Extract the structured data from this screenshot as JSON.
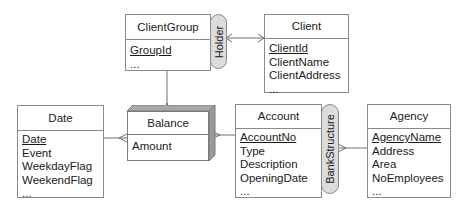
{
  "diagram": {
    "type": "entity-relationship",
    "entities": [
      {
        "id": "clientgroup",
        "name": "ClientGroup",
        "key": "GroupId",
        "attributes": [
          "..."
        ]
      },
      {
        "id": "client",
        "name": "Client",
        "key": "ClientId",
        "attributes": [
          "ClientName",
          "ClientAddress",
          "..."
        ]
      },
      {
        "id": "date",
        "name": "Date",
        "key": "Date",
        "attributes": [
          "Event",
          "WeekdayFlag",
          "WeekendFlag",
          "..."
        ]
      },
      {
        "id": "balance",
        "name": "Balance",
        "key": "",
        "attributes": [
          "Amount"
        ],
        "style": "fact-3d"
      },
      {
        "id": "account",
        "name": "Account",
        "key": "AccountNo",
        "attributes": [
          "Type",
          "Description",
          "OpeningDate",
          "..."
        ]
      },
      {
        "id": "agency",
        "name": "Agency",
        "key": "AgencyName",
        "attributes": [
          "Address",
          "Area",
          "NoEmployees",
          "..."
        ]
      }
    ],
    "relationships": [
      {
        "name": "Holder",
        "between": [
          "ClientGroup",
          "Client"
        ]
      },
      {
        "name": "BankStructure",
        "between": [
          "Account",
          "Agency"
        ]
      }
    ],
    "links": [
      {
        "from": "ClientGroup",
        "to": "Balance",
        "many_end": "Balance"
      },
      {
        "from": "Date",
        "to": "Balance",
        "many_end": "Balance"
      },
      {
        "from": "Account",
        "to": "Balance",
        "many_end": "Balance"
      },
      {
        "from": "Holder",
        "to": "ClientGroup",
        "many_end": "Holder"
      },
      {
        "from": "Holder",
        "to": "Client",
        "many_end": "Client"
      },
      {
        "from": "BankStructure",
        "to": "Agency",
        "many_end": "BankStructure"
      }
    ]
  }
}
